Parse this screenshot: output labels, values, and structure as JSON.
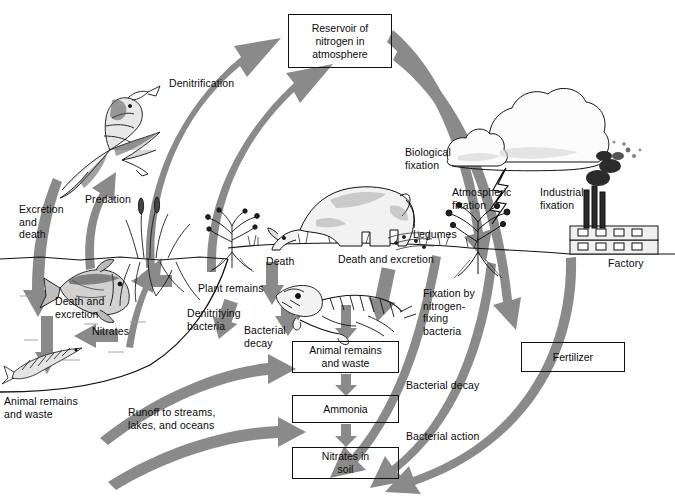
{
  "diagram": {
    "palette": {
      "arrow_gray": "#8a8a8a",
      "arrow_gray_dark": "#7b7b7b",
      "ink": "#111111",
      "background": "#ffffff"
    },
    "boxes": [
      {
        "id": "reservoir",
        "text": "Reservoir of\nnitrogen in\natmosphere",
        "x": 288,
        "y": 14,
        "w": 104,
        "h": 54
      },
      {
        "id": "animal-remains",
        "text": "Animal remains\nand waste",
        "x": 292,
        "y": 341,
        "w": 107,
        "h": 32
      },
      {
        "id": "ammonia",
        "text": "Ammonia",
        "x": 292,
        "y": 395,
        "w": 107,
        "h": 28
      },
      {
        "id": "nitrates-soil",
        "text": "Nitrates in\nsoil",
        "x": 292,
        "y": 447,
        "w": 107,
        "h": 32
      },
      {
        "id": "fertilizer",
        "text": "Fertilizer",
        "x": 521,
        "y": 342,
        "w": 104,
        "h": 30
      }
    ],
    "labels": [
      {
        "id": "denitrification",
        "text": "Denitrification",
        "x": 169,
        "y": 77
      },
      {
        "id": "predation",
        "text": "Predation",
        "x": 85,
        "y": 193
      },
      {
        "id": "excretion-and-death",
        "text": "Excretion\nand\ndeath",
        "x": 19,
        "y": 203
      },
      {
        "id": "death-and-excretion-water",
        "text": "Death and\nexcretion",
        "x": 55,
        "y": 295
      },
      {
        "id": "nitrates-water",
        "text": "Nitrates",
        "x": 92,
        "y": 325
      },
      {
        "id": "animal-remains-waste-left",
        "text": "Animal remains\nand waste",
        "x": 4,
        "y": 395
      },
      {
        "id": "runoff",
        "text": "Runoff to streams,\nlakes, and oceans",
        "x": 128,
        "y": 406
      },
      {
        "id": "denitrifying-bacteria",
        "text": "Denitrifying\nbacteria",
        "x": 187,
        "y": 307
      },
      {
        "id": "plant-remains",
        "text": "Plant remains",
        "x": 198,
        "y": 282
      },
      {
        "id": "death-center",
        "text": "Death",
        "x": 266,
        "y": 255
      },
      {
        "id": "bacterial-decay-center",
        "text": "Bacterial\ndecay",
        "x": 244,
        "y": 324
      },
      {
        "id": "death-and-excretion-land",
        "text": "Death and excretion",
        "x": 338,
        "y": 253
      },
      {
        "id": "legumes",
        "text": "Legumes",
        "x": 413,
        "y": 228
      },
      {
        "id": "biological-fixation",
        "text": "Biological\nfixation",
        "x": 405,
        "y": 146
      },
      {
        "id": "atmospheric-fixation",
        "text": "Atmospheric\nfixation",
        "x": 452,
        "y": 186
      },
      {
        "id": "industrial-fixation",
        "text": "Industrial\nfixation",
        "x": 540,
        "y": 186
      },
      {
        "id": "factory",
        "text": "Factory",
        "x": 608,
        "y": 257
      },
      {
        "id": "fixation-by-bacteria",
        "text": "Fixation by\nnitrogen-\nfixing\nbacteria",
        "x": 423,
        "y": 287
      },
      {
        "id": "bacterial-decay-chain",
        "text": "Bacterial decay",
        "x": 406,
        "y": 379
      },
      {
        "id": "bacterial-action-chain",
        "text": "Bacterial action",
        "x": 406,
        "y": 430
      }
    ],
    "flows": [
      {
        "from": "water-excretion",
        "to": "reservoir",
        "label": "Denitrification"
      },
      {
        "from": "fish",
        "to": "bird",
        "label": "Predation"
      },
      {
        "from": "bird",
        "to": "water",
        "label": "Excretion and death"
      },
      {
        "from": "reservoir",
        "to": "legumes",
        "label": "Biological fixation"
      },
      {
        "from": "atmosphere",
        "to": "soil",
        "label": "Atmospheric fixation"
      },
      {
        "from": "factory",
        "to": "fertilizer",
        "label": "Industrial fixation"
      },
      {
        "from": "animal-remains",
        "to": "ammonia",
        "label": "Bacterial decay"
      },
      {
        "from": "ammonia",
        "to": "nitrates-soil",
        "label": "Bacterial action"
      },
      {
        "from": "nitrates-soil",
        "to": "water",
        "label": "Runoff to streams, lakes, and oceans"
      }
    ]
  }
}
